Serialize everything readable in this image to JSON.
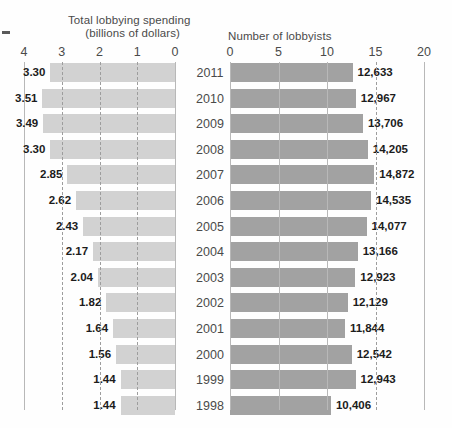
{
  "corner_mark": "–",
  "left_panel": {
    "title_line1": "Total lobbying spending",
    "title_line2": "(billions of dollars)",
    "ticks": [
      "4",
      "3",
      "2",
      "1",
      "0"
    ]
  },
  "right_panel": {
    "title": "Number of lobbyists",
    "ticks": [
      "0",
      "5",
      "10",
      "15",
      "20"
    ]
  },
  "years": [
    "2011",
    "2010",
    "2009",
    "2008",
    "2007",
    "2006",
    "2005",
    "2004",
    "2003",
    "2002",
    "2001",
    "2000",
    "1999",
    "1998"
  ],
  "spending_labels": [
    "3.30",
    "3.51",
    "3.49",
    "3.30",
    "2.85",
    "2.62",
    "2.43",
    "2.17",
    "2.04",
    "1.82",
    "1.64",
    "1.56",
    "1.44",
    "1.44"
  ],
  "lobbyist_labels": [
    "12,633",
    "12,967",
    "13,706",
    "14,205",
    "14,872",
    "14,535",
    "14,077",
    "13,166",
    "12,923",
    "12,129",
    "11,844",
    "12,542",
    "12,943",
    "10,406"
  ],
  "colors": {
    "spending_bar": "#d2d2d2",
    "lobbyist_bar": "#a2a2a2",
    "gridline": "#b8b8b8",
    "text": "#4a4a4a",
    "value_text": "#1c1c1c"
  },
  "chart_data": {
    "type": "bar",
    "title": "",
    "orientation": "horizontal",
    "panels": [
      {
        "name": "spending",
        "title": "Total lobbying spending (billions of dollars)",
        "xlabel": "billions of dollars",
        "ylabel": "",
        "direction": "right-to-left",
        "xlim": [
          0,
          4
        ],
        "xticks": [
          4,
          3,
          2,
          1,
          0
        ],
        "grid": true,
        "categories": [
          "2011",
          "2010",
          "2009",
          "2008",
          "2007",
          "2006",
          "2005",
          "2004",
          "2003",
          "2002",
          "2001",
          "2000",
          "1999",
          "1998"
        ],
        "values": [
          3.3,
          3.51,
          3.49,
          3.3,
          2.85,
          2.62,
          2.43,
          2.17,
          2.04,
          1.82,
          1.64,
          1.56,
          1.44,
          1.44
        ]
      },
      {
        "name": "lobbyists",
        "title": "Number of lobbyists",
        "xlabel": "thousands of lobbyists",
        "ylabel": "",
        "direction": "left-to-right",
        "xlim": [
          0,
          20
        ],
        "xticks": [
          0,
          5,
          10,
          15,
          20
        ],
        "grid": true,
        "categories": [
          "2011",
          "2010",
          "2009",
          "2008",
          "2007",
          "2006",
          "2005",
          "2004",
          "2003",
          "2002",
          "2001",
          "2000",
          "1999",
          "1998"
        ],
        "values": [
          12633,
          12967,
          13706,
          14205,
          14872,
          14535,
          14077,
          13166,
          12923,
          12129,
          11844,
          12542,
          12943,
          10406
        ]
      }
    ],
    "legend": [],
    "annotations": []
  }
}
